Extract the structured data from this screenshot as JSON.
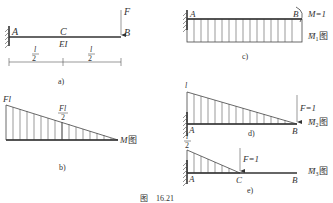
{
  "figure": {
    "caption_prefix": "图",
    "caption_number": "16.21",
    "colors": {
      "ink": "#333333",
      "background": "#ffffff"
    }
  },
  "panel_a": {
    "label": "a)",
    "point_A": "A",
    "point_C": "C",
    "point_B": "B",
    "load": "F",
    "stiffness": "EI",
    "span_left_num": "l",
    "span_left_den": "2",
    "span_right_num": "l",
    "span_right_den": "2"
  },
  "panel_b": {
    "label": "b)",
    "max_value": "Fl",
    "mid_value_num": "Fl",
    "mid_value_den": "2",
    "diagram_name_symbol": "M",
    "diagram_name_suffix": "图"
  },
  "panel_c": {
    "label": "c)",
    "point_A": "A",
    "point_B": "B",
    "unit_moment": "M=1",
    "diagram_name_symbol": "M̄",
    "diagram_name_sub": "1",
    "diagram_name_suffix": "图"
  },
  "panel_d": {
    "label": "d)",
    "point_A": "A",
    "point_B": "B",
    "max_value": "l",
    "unit_load": "F=1",
    "diagram_name_symbol": "M̄",
    "diagram_name_sub": "2",
    "diagram_name_suffix": "图"
  },
  "panel_e": {
    "label": "e)",
    "point_A": "A",
    "point_C": "C",
    "point_B": "B",
    "max_value_num": "l",
    "max_value_den": "2",
    "unit_load": "F=1",
    "diagram_name_symbol": "M̄",
    "diagram_name_sub": "3",
    "diagram_name_suffix": "图"
  }
}
